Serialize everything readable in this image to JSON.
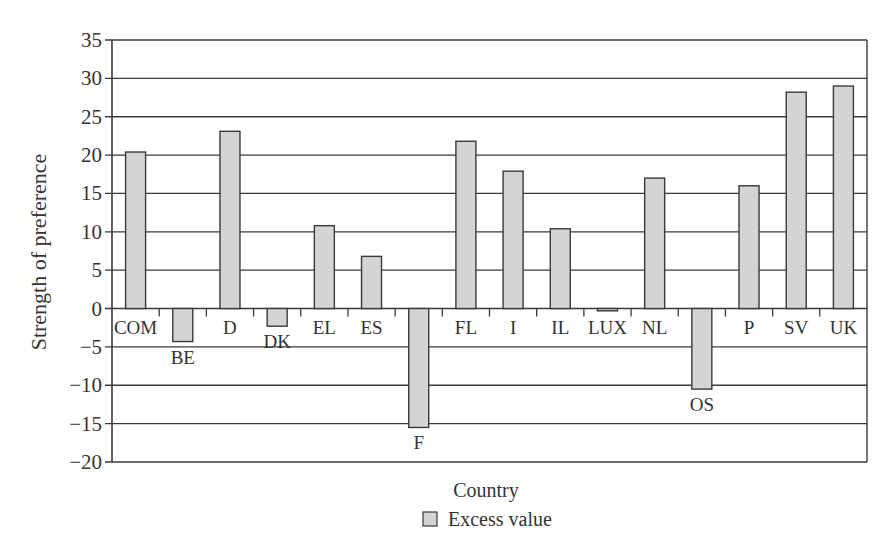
{
  "chart_data": {
    "type": "bar",
    "title": "",
    "xlabel": "Country",
    "ylabel": "Strength of preference",
    "ylim": [
      -20,
      35
    ],
    "yticks": [
      35,
      30,
      25,
      20,
      15,
      10,
      5,
      0,
      -5,
      -10,
      -15,
      -20
    ],
    "ytick_labels": [
      "35",
      "30",
      "25",
      "20",
      "15",
      "10",
      "5",
      "0",
      "−5",
      "−10",
      "−15",
      "−20"
    ],
    "grid": true,
    "legend_position": "bottom",
    "categories": [
      "COM",
      "BE",
      "D",
      "DK",
      "EL",
      "ES",
      "F",
      "FL",
      "I",
      "IL",
      "LUX",
      "NL",
      "OS",
      "P",
      "SV",
      "UK"
    ],
    "series": [
      {
        "name": "Excess value",
        "color": "#d4d4d4",
        "values": [
          20.4,
          -4.3,
          23.1,
          -2.3,
          10.8,
          6.8,
          -15.5,
          21.8,
          17.9,
          10.4,
          -0.3,
          17.0,
          -10.5,
          16.0,
          28.2,
          29.0
        ]
      }
    ]
  },
  "colors": {
    "bar_fill": "#d4d4d4",
    "bar_stroke": "#3a3a3a",
    "grid": "#3a3a3a",
    "text": "#333333"
  }
}
